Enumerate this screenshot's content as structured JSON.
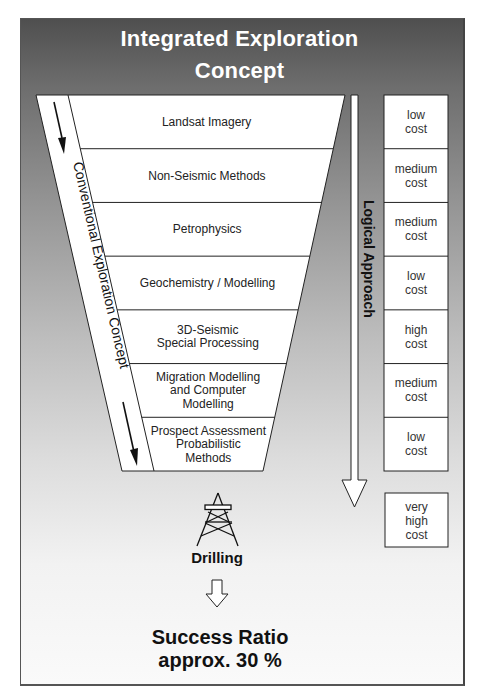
{
  "title": {
    "line1": "Integrated Exploration",
    "line2": "Concept"
  },
  "funnel": {
    "left_label": "Conventional Exploration Concept",
    "tiers": [
      {
        "lines": [
          "Landsat Imagery"
        ],
        "cost": [
          "low",
          "cost"
        ]
      },
      {
        "lines": [
          "Non-Seismic Methods"
        ],
        "cost": [
          "medium",
          "cost"
        ]
      },
      {
        "lines": [
          "Petrophysics"
        ],
        "cost": [
          "medium",
          "cost"
        ]
      },
      {
        "lines": [
          "Geochemistry / Modelling"
        ],
        "cost": [
          "low",
          "cost"
        ]
      },
      {
        "lines": [
          "3D-Seismic",
          "Special Processing"
        ],
        "cost": [
          "high",
          "cost"
        ]
      },
      {
        "lines": [
          "Migration Modelling",
          "and Computer",
          "Modelling"
        ],
        "cost": [
          "medium",
          "cost"
        ]
      },
      {
        "lines": [
          "Prospect Assessment",
          "Probabilistic",
          "Methods"
        ],
        "cost": [
          "low",
          "cost"
        ]
      }
    ]
  },
  "logical_approach": {
    "label": "Logical Approach"
  },
  "drilling": {
    "label": "Drilling",
    "cost": [
      "very",
      "high",
      "cost"
    ],
    "icon": "drilling-rig-icon"
  },
  "result": {
    "line1": "Success Ratio",
    "line2": "approx. 30 %"
  }
}
